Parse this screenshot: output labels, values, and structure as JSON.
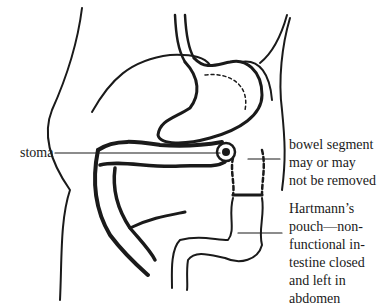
{
  "diagram": {
    "type": "anatomical illustration",
    "labels": {
      "stoma": "stoma",
      "bowel_segment": [
        "bowel segment",
        "may or may",
        "not be removed"
      ],
      "hartmanns_pouch": [
        "Hartmann’s",
        "pouch—non-",
        "functional in-",
        "testine closed",
        "and left in",
        "abdomen"
      ]
    },
    "colors": {
      "ink": "#1a1a1a",
      "background": "#ffffff"
    }
  }
}
